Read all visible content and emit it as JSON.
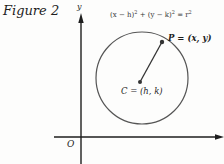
{
  "figure": {
    "caption": "Figure 2",
    "equation": {
      "left_paren_x": "(x − h)",
      "plus": " + ",
      "left_paren_y": "(y − k)",
      "exp": "2",
      "equals": " = r",
      "r_exp": "2",
      "full": "(x − h)² + (y − k)² = r²"
    },
    "point_p_label": "P = (x, y)",
    "point_c_label": "C = (h, k)",
    "origin_label": "O",
    "y_axis_label": "y",
    "colors": {
      "ink": "#1e1e1e",
      "circle": "#555555",
      "background": "#fdfdfc"
    },
    "geometry": {
      "x_axis": {
        "x1": 54,
        "x2": 222,
        "y": 137
      },
      "y_axis": {
        "x": 81,
        "y1": 164,
        "y2": 13
      },
      "circle": {
        "cx": 142,
        "cy": 78,
        "r": 46
      },
      "center_point": {
        "x": 140,
        "y": 82
      },
      "p_point": {
        "x": 162,
        "y": 42
      }
    }
  }
}
